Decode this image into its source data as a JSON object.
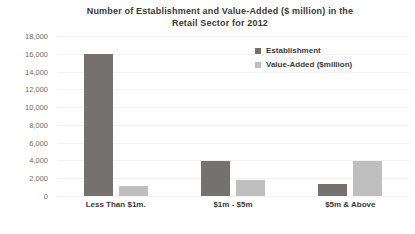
{
  "chart_data": {
    "type": "bar",
    "title": "Number of Establishment and Value-Added ($ million) in the Retail Sector for 2012",
    "title_lines": [
      "Number of Establishment and Value-Added ($ million) in the",
      "Retail Sector for 2012"
    ],
    "categories": [
      "Less Than $1m.",
      "$1m - $5m",
      "$5m & Above"
    ],
    "series": [
      {
        "name": "Establishment",
        "values": [
          16000,
          3900,
          1350
        ],
        "color": "#767171"
      },
      {
        "name": "Value-Added ($million)",
        "values": [
          1100,
          1800,
          3900
        ],
        "color": "#bfbfbf"
      }
    ],
    "xlabel": "",
    "ylabel": "",
    "ylim": [
      0,
      18000
    ],
    "yticks": [
      18000,
      16000,
      14000,
      12000,
      10000,
      8000,
      6000,
      4000,
      2000,
      0
    ],
    "ytick_labels": [
      "18,000",
      "16,000",
      "14,000",
      "12,000",
      "10,000",
      "8,000",
      "6,000",
      "4,000",
      "2,000",
      "0"
    ],
    "grid": true,
    "legend_position": "top-right"
  }
}
